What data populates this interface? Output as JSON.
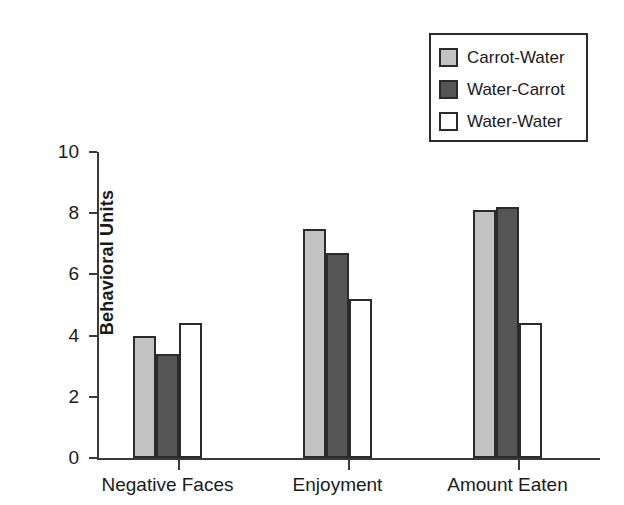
{
  "chart_data": {
    "type": "bar",
    "title": "",
    "subtitle": "",
    "xlabel": "",
    "ylabel": "Behavioral Units",
    "categories": [
      "Negative Faces",
      "Enjoyment",
      "Amount Eaten"
    ],
    "series": [
      {
        "name": "Carrot-Water",
        "values": [
          4.0,
          7.5,
          8.1
        ],
        "color": "#c2c2c2"
      },
      {
        "name": "Water-Carrot",
        "values": [
          3.4,
          6.7,
          8.2
        ],
        "color": "#555555"
      },
      {
        "name": "Water-Water",
        "values": [
          4.4,
          5.2,
          4.4
        ],
        "color": "#ffffff"
      }
    ],
    "ylim": [
      0,
      10
    ],
    "yticks": [
      0,
      2,
      4,
      6,
      8,
      10
    ],
    "ytick_labels": [
      "0",
      "2",
      "4",
      "6",
      "8",
      "10"
    ],
    "grid": false,
    "legend_position": "top-right",
    "bar_edge_color": "#2b2b2b",
    "axis_color": "#3a3a3a"
  },
  "legend": {
    "items": [
      {
        "label": "Carrot-Water"
      },
      {
        "label": "Water-Carrot"
      },
      {
        "label": "Water-Water"
      }
    ]
  }
}
